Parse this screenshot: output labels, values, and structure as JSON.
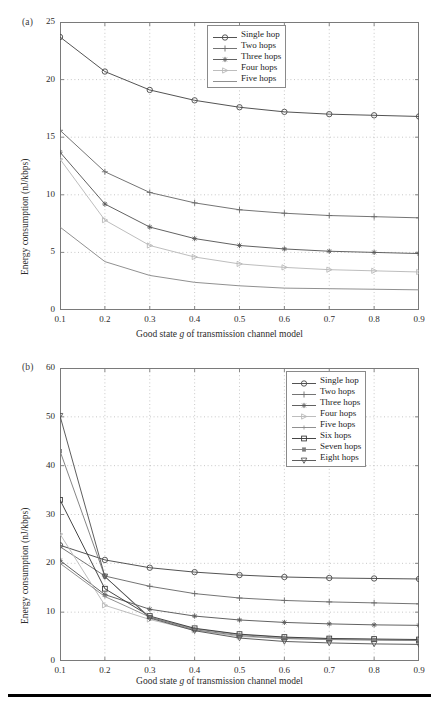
{
  "figure": {
    "panels": [
      {
        "tag": "(a)",
        "ylabel": "Energy consumption (nJ/kbps)",
        "xlabel_pre": "Good state ",
        "xlabel_italic": "g",
        "xlabel_post": " of transmission channel model",
        "yticks": [
          "0",
          "5",
          "10",
          "15",
          "20",
          "25"
        ],
        "xticks": [
          "0.1",
          "0.2",
          "0.3",
          "0.4",
          "0.5",
          "0.6",
          "0.7",
          "0.8",
          "0.9"
        ],
        "legend": [
          "Single hop",
          "Two hops",
          "Three hops",
          "Four hops",
          "Five hops"
        ]
      },
      {
        "tag": "(b)",
        "ylabel": "Energy consumption (nJ/kbps)",
        "xlabel_pre": "Good state ",
        "xlabel_italic": "g",
        "xlabel_post": " of transmission channel model",
        "yticks": [
          "0",
          "10",
          "20",
          "30",
          "40",
          "50",
          "60"
        ],
        "xticks": [
          "0.1",
          "0.2",
          "0.3",
          "0.4",
          "0.5",
          "0.6",
          "0.7",
          "0.8",
          "0.9"
        ],
        "legend": [
          "Single hop",
          "Two hops",
          "Three hops",
          "Four hops",
          "Five hops",
          "Six hops",
          "Seven hops",
          "Eight hops"
        ]
      }
    ]
  },
  "chart_data": [
    {
      "panel": "(a)",
      "type": "line",
      "title": "",
      "xlabel": "Good state g of transmission channel model",
      "ylabel": "Energy consumption (nJ/kbps)",
      "x": [
        0.1,
        0.2,
        0.3,
        0.4,
        0.5,
        0.6,
        0.7,
        0.8,
        0.9
      ],
      "xlim": [
        0.1,
        0.9
      ],
      "ylim": [
        0,
        25
      ],
      "grid": true,
      "legend_position": "upper-right",
      "series": [
        {
          "name": "Single hop",
          "marker": "circle",
          "values": [
            23.7,
            20.7,
            19.1,
            18.2,
            17.6,
            17.2,
            17.0,
            16.9,
            16.8
          ]
        },
        {
          "name": "Two hops",
          "marker": "plus",
          "values": [
            15.6,
            12.0,
            10.2,
            9.3,
            8.7,
            8.4,
            8.2,
            8.1,
            8.0
          ]
        },
        {
          "name": "Three hops",
          "marker": "asterisk",
          "values": [
            13.7,
            9.2,
            7.2,
            6.2,
            5.6,
            5.3,
            5.1,
            5.0,
            4.9
          ]
        },
        {
          "name": "Four hops",
          "marker": "triangle-right",
          "values": [
            13.1,
            7.8,
            5.6,
            4.6,
            4.0,
            3.7,
            3.5,
            3.4,
            3.3
          ]
        },
        {
          "name": "Five hops",
          "marker": "none",
          "values": [
            7.2,
            4.2,
            3.0,
            2.4,
            2.1,
            1.9,
            1.85,
            1.8,
            1.75
          ]
        }
      ]
    },
    {
      "panel": "(b)",
      "type": "line",
      "title": "",
      "xlabel": "Good state g of transmission channel model",
      "ylabel": "Energy consumption (nJ/kbps)",
      "x": [
        0.1,
        0.2,
        0.3,
        0.4,
        0.5,
        0.6,
        0.7,
        0.8,
        0.9
      ],
      "xlim": [
        0.1,
        0.9
      ],
      "ylim": [
        0,
        60
      ],
      "grid": true,
      "legend_position": "upper-right",
      "series": [
        {
          "name": "Single hop",
          "marker": "circle",
          "values": [
            23.7,
            20.7,
            19.1,
            18.2,
            17.6,
            17.2,
            17.0,
            16.9,
            16.8
          ]
        },
        {
          "name": "Two hops",
          "marker": "plus",
          "values": [
            23.4,
            17.4,
            15.3,
            13.8,
            12.9,
            12.4,
            12.1,
            11.9,
            11.7
          ]
        },
        {
          "name": "Three hops",
          "marker": "asterisk",
          "values": [
            20.6,
            13.6,
            10.6,
            9.2,
            8.4,
            7.9,
            7.6,
            7.4,
            7.3
          ]
        },
        {
          "name": "Four hops",
          "marker": "triangle-right",
          "values": [
            26.0,
            11.4,
            8.5,
            6.3,
            5.0,
            4.6,
            4.4,
            4.3,
            4.2
          ]
        },
        {
          "name": "Five hops",
          "marker": "dot",
          "values": [
            20.0,
            13.2,
            9.0,
            6.6,
            5.4,
            4.8,
            4.6,
            4.4,
            4.3
          ]
        },
        {
          "name": "Six hops",
          "marker": "square",
          "values": [
            33.0,
            14.8,
            9.2,
            6.7,
            5.5,
            4.9,
            4.6,
            4.5,
            4.4
          ]
        },
        {
          "name": "Seven hops",
          "marker": "square-small",
          "values": [
            43.0,
            17.3,
            9.0,
            6.4,
            5.2,
            4.6,
            4.4,
            4.3,
            4.2
          ]
        },
        {
          "name": "Eight hops",
          "marker": "triangle-down",
          "values": [
            50.2,
            17.3,
            8.8,
            6.2,
            4.7,
            4.0,
            3.7,
            3.5,
            3.4
          ]
        }
      ]
    }
  ]
}
